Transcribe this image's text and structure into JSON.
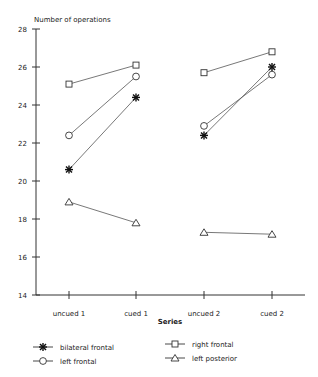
{
  "chart_data": {
    "type": "line",
    "title": "",
    "ylabel": "Number of operations",
    "xlabel": "Series",
    "categories": [
      "uncued 1",
      "cued 1",
      "uncued 2",
      "cued 2"
    ],
    "ylim": [
      14,
      28
    ],
    "yticks": [
      14,
      16,
      18,
      20,
      22,
      24,
      26,
      28
    ],
    "grid": false,
    "legend_position": "bottom",
    "note": "Lines connect uncued->cued within each pair only",
    "series": [
      {
        "name": "bilateral frontal",
        "marker": "asterisk",
        "values": [
          20.6,
          24.4,
          22.4,
          26.0
        ]
      },
      {
        "name": "right frontal",
        "marker": "square",
        "values": [
          25.1,
          26.1,
          25.7,
          26.8
        ]
      },
      {
        "name": "left frontal",
        "marker": "circle",
        "values": [
          22.4,
          25.5,
          22.9,
          25.6
        ]
      },
      {
        "name": "left posterior",
        "marker": "triangle",
        "values": [
          18.9,
          17.8,
          17.3,
          17.2
        ]
      }
    ]
  },
  "labels": {
    "ylabel": "Number of operations",
    "xlabel": "Series",
    "legend": [
      "bilateral frontal",
      "left frontal",
      "right frontal",
      "left posterior"
    ]
  }
}
